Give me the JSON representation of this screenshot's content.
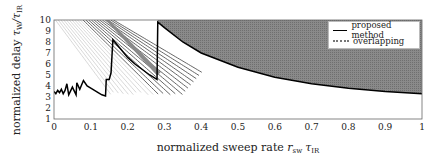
{
  "chart_data": {
    "type": "line",
    "title": "",
    "xlabel": "normalized sweep rate r_sw τ_IR",
    "ylabel": "normalized delay τ_W/τ_IR",
    "xlim": [
      0,
      1
    ],
    "ylim": [
      1,
      10
    ],
    "x_ticks": [
      "0",
      "0.1",
      "0.2",
      "0.3",
      "0.4",
      "0.5",
      "0.6",
      "0.7",
      "0.8",
      "0.9",
      "1"
    ],
    "y_ticks": [
      "1",
      "2",
      "3",
      "4",
      "5",
      "6",
      "7",
      "8",
      "9",
      "10"
    ],
    "grid": false,
    "legend_position": "upper right",
    "series": [
      {
        "name": "proposed method",
        "style": "solid black line",
        "x": [
          0.0,
          0.005,
          0.01,
          0.015,
          0.02,
          0.025,
          0.03,
          0.035,
          0.04,
          0.05,
          0.06,
          0.062,
          0.07,
          0.08,
          0.09,
          0.1,
          0.11,
          0.12,
          0.13,
          0.14,
          0.142,
          0.15,
          0.155,
          0.16,
          0.18,
          0.2,
          0.22,
          0.24,
          0.26,
          0.28,
          0.282,
          0.3,
          0.35,
          0.4,
          0.5,
          0.6,
          0.7,
          0.8,
          0.9,
          1.0
        ],
        "y": [
          3.5,
          3.3,
          3.6,
          3.4,
          3.7,
          3.3,
          3.6,
          4.2,
          3.2,
          3.9,
          3.2,
          4.3,
          3.7,
          4.5,
          4.0,
          3.8,
          3.6,
          3.4,
          3.2,
          3.1,
          4.6,
          4.6,
          5.2,
          8.2,
          7.4,
          6.6,
          6.0,
          5.5,
          5.0,
          4.6,
          9.8,
          9.3,
          8.0,
          7.0,
          5.7,
          4.8,
          4.2,
          3.8,
          3.5,
          3.3
        ]
      },
      {
        "name": "overlapping",
        "style": "dotted gray fill region",
        "description": "Shaded region above the proposed-method curve for r_sw τ_IR ≥ 0.28, extending to the upper limit 10; many overlapping decreasing curves for r_sw τ_IR < 0.28"
      }
    ]
  },
  "legend": {
    "items": [
      {
        "label": "proposed method"
      },
      {
        "label": "overlapping"
      }
    ]
  },
  "axes": {
    "xlabel_text": "normalized sweep rate ",
    "xlabel_math": "r",
    "xlabel_sub": "sw",
    "xlabel_math2": "τ",
    "xlabel_sub2": "IR",
    "ylabel_text": "normalized delay ",
    "ylabel_math": "τ",
    "ylabel_sub": "W",
    "ylabel_slash": "/τ",
    "ylabel_sub2": "IR"
  }
}
